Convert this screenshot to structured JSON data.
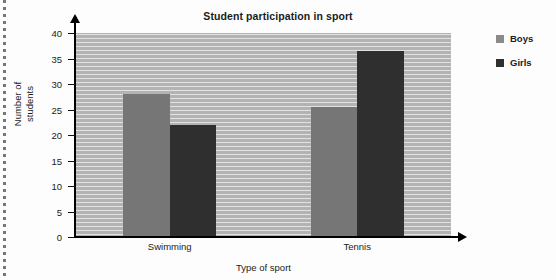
{
  "chart_data": {
    "type": "bar",
    "title": "Student participation in sport",
    "xlabel": "Type of sport",
    "ylabel": "Number of students",
    "ylabel_lines": [
      "Number of",
      "students"
    ],
    "categories": [
      "Swimming",
      "Tennis"
    ],
    "series": [
      {
        "name": "Boys",
        "values": [
          28,
          25.5
        ],
        "color": "#767676"
      },
      {
        "name": "Girls",
        "values": [
          22,
          36.5
        ],
        "color": "#2f2f2f"
      }
    ],
    "ylim": [
      0,
      40
    ],
    "ytick_step": 5,
    "yticks": [
      0,
      5,
      10,
      15,
      20,
      25,
      30,
      35,
      40
    ],
    "ytick_labels": [
      "0",
      "5",
      "10",
      "15",
      "20",
      "25",
      "30",
      "35",
      "40"
    ],
    "grid": false,
    "plot_background": "#b3b3b3",
    "legend_position": "right",
    "axis_arrows": true
  },
  "legend": {
    "entries": [
      {
        "label": "Boys",
        "swatch": "legend-swatch-boys"
      },
      {
        "label": "Girls",
        "swatch": "legend-swatch-girls"
      }
    ]
  }
}
